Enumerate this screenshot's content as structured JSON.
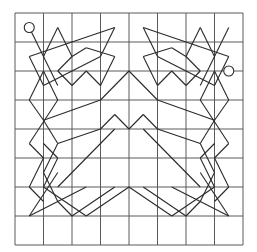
{
  "diagram": {
    "title": "",
    "grid": {
      "columns": 8,
      "rows": 8,
      "origin_px": [
        15,
        13
      ],
      "cell_w_px": 28.5,
      "cell_h_px": 29,
      "line_color": "#5a5a5a"
    },
    "stroke_color": "#2a2a2a",
    "background": "#ffffff",
    "endpoints": [
      {
        "name": "start-circle",
        "c": 0.5,
        "r": 0.5,
        "radius_px": 5
      },
      {
        "name": "end-circle",
        "c": 7.5,
        "r": 2.0,
        "radius_px": 5
      }
    ],
    "segments_left_half": [
      [
        [
          0.5,
          0.5
        ],
        [
          1.5,
          2.5
        ]
      ],
      [
        [
          1.5,
          0.5
        ],
        [
          1.0,
          1.5
        ]
      ],
      [
        [
          1.5,
          0.5
        ],
        [
          2.0,
          1.5
        ]
      ],
      [
        [
          0.5,
          1.5
        ],
        [
          1.0,
          2.5
        ]
      ],
      [
        [
          0.5,
          1.5
        ],
        [
          3.5,
          0.5
        ]
      ],
      [
        [
          3.5,
          0.5
        ],
        [
          3.0,
          1.5
        ]
      ],
      [
        [
          1.0,
          2.5
        ],
        [
          3.0,
          1.5
        ]
      ],
      [
        [
          2.0,
          1.5
        ],
        [
          2.5,
          1.2
        ]
      ],
      [
        [
          1.5,
          2.0
        ],
        [
          2.0,
          1.5
        ]
      ],
      [
        [
          1.5,
          2.0
        ],
        [
          2.0,
          2.5
        ]
      ],
      [
        [
          2.0,
          2.5
        ],
        [
          2.5,
          2.0
        ]
      ],
      [
        [
          2.5,
          2.0
        ],
        [
          3.0,
          2.5
        ]
      ],
      [
        [
          3.0,
          2.5
        ],
        [
          3.5,
          1.5
        ]
      ],
      [
        [
          2.5,
          1.2
        ],
        [
          3.5,
          1.5
        ]
      ],
      [
        [
          1.0,
          2.0
        ],
        [
          0.5,
          3.0
        ]
      ],
      [
        [
          0.5,
          3.0
        ],
        [
          1.0,
          3.7
        ]
      ],
      [
        [
          1.0,
          2.0
        ],
        [
          1.5,
          3.0
        ]
      ],
      [
        [
          1.5,
          3.0
        ],
        [
          0.5,
          4.5
        ]
      ],
      [
        [
          1.0,
          3.7
        ],
        [
          3.0,
          3.0
        ]
      ],
      [
        [
          3.0,
          3.0
        ],
        [
          4.0,
          2.0
        ]
      ],
      [
        [
          0.5,
          4.5
        ],
        [
          1.0,
          5.0
        ]
      ],
      [
        [
          1.0,
          5.0
        ],
        [
          0.5,
          6.0
        ]
      ],
      [
        [
          0.5,
          6.0
        ],
        [
          1.0,
          6.5
        ]
      ],
      [
        [
          1.0,
          3.7
        ],
        [
          1.5,
          4.5
        ]
      ],
      [
        [
          1.5,
          4.5
        ],
        [
          1.0,
          5.5
        ]
      ],
      [
        [
          1.0,
          4.5
        ],
        [
          1.5,
          5.0
        ]
      ],
      [
        [
          1.5,
          5.0
        ],
        [
          1.0,
          6.0
        ]
      ],
      [
        [
          1.0,
          6.0
        ],
        [
          2.5,
          7.0
        ]
      ],
      [
        [
          0.5,
          7.0
        ],
        [
          1.5,
          5.5
        ]
      ],
      [
        [
          1.0,
          5.5
        ],
        [
          1.5,
          6.5
        ]
      ],
      [
        [
          1.5,
          6.5
        ],
        [
          2.0,
          7.0
        ]
      ],
      [
        [
          0.5,
          7.0
        ],
        [
          2.5,
          6.0
        ]
      ],
      [
        [
          2.0,
          7.0
        ],
        [
          3.5,
          6.0
        ]
      ],
      [
        [
          2.5,
          7.0
        ],
        [
          4.0,
          6.0
        ]
      ],
      [
        [
          1.5,
          4.5
        ],
        [
          3.0,
          4.0
        ]
      ],
      [
        [
          3.0,
          4.0
        ],
        [
          3.5,
          3.5
        ]
      ],
      [
        [
          3.5,
          3.5
        ],
        [
          4.0,
          4.0
        ]
      ],
      [
        [
          1.5,
          6.0
        ],
        [
          3.5,
          4.0
        ]
      ]
    ]
  }
}
